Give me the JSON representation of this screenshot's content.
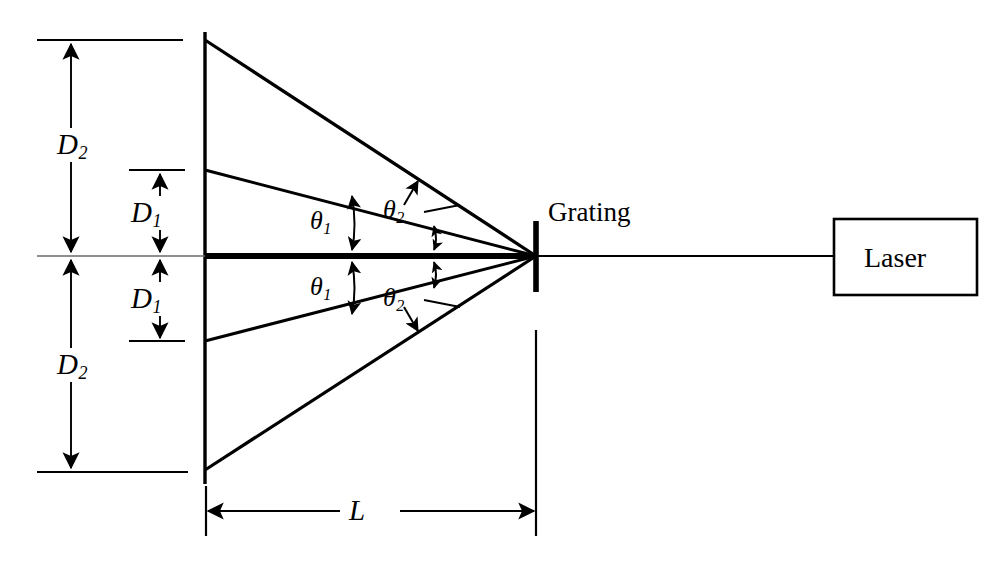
{
  "figure": {
    "type": "optics-ray-diagram"
  },
  "labels": {
    "laser": "Laser",
    "grating": "Grating",
    "distance_L": "L",
    "distance_D1": "D",
    "distance_D1_sub": "1",
    "distance_D2": "D",
    "distance_D2_sub": "2",
    "angle_theta1": "θ",
    "angle_theta1_sub": "1",
    "angle_theta2": "θ",
    "angle_theta2_sub": "2"
  },
  "annotations": {
    "d1_top_label": "D",
    "d1_top_sub": "1",
    "d1_bottom_label": "D",
    "d1_bottom_sub": "1",
    "d2_top_label": "D",
    "d2_top_sub": "2",
    "d2_bottom_label": "D",
    "d2_bottom_sub": "2",
    "theta1_top_label": "θ",
    "theta1_top_sub": "1",
    "theta1_bottom_label": "θ",
    "theta1_bottom_sub": "1",
    "theta2_top_label": "θ",
    "theta2_top_sub": "2",
    "theta2_bottom_label": "θ",
    "theta2_bottom_sub": "2"
  },
  "colors": {
    "stroke": "#000000",
    "axis": "#555555",
    "background": "#ffffff"
  },
  "geometry": {
    "grating_x": 536,
    "axis_y": 256,
    "screen_x": 205,
    "screen_top_y": 32,
    "screen_bottom_y": 484,
    "beam_y": [
      40,
      170,
      256,
      341,
      470
    ],
    "laser_box": {
      "x": 834,
      "y": 219,
      "w": 143,
      "h": 76
    },
    "L_dimension_y": 511
  }
}
